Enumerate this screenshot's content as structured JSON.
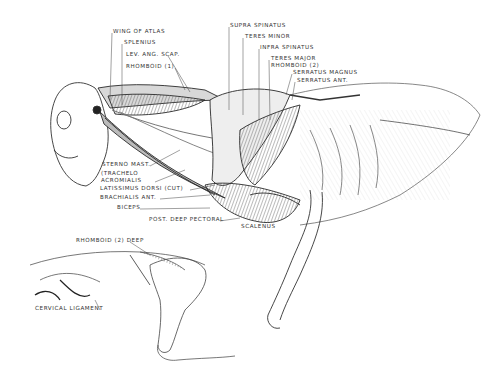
{
  "diagram": {
    "labels_top_left": [
      {
        "text": "Wing of Atlas",
        "x": 113,
        "y": 31
      },
      {
        "text": "Splenius",
        "x": 124,
        "y": 42
      },
      {
        "text": "Lev. Ang. Scap.",
        "x": 126,
        "y": 54
      },
      {
        "text": "Rhomboid (1)",
        "x": 126,
        "y": 66
      }
    ],
    "labels_top_right": [
      {
        "text": "Supra Spinatus",
        "x": 230,
        "y": 25
      },
      {
        "text": "Teres Minor",
        "x": 245,
        "y": 36
      },
      {
        "text": "Infra Spinatus",
        "x": 260,
        "y": 47
      },
      {
        "text": "Teres Major",
        "x": 271,
        "y": 58
      },
      {
        "text": "Rhomboid (2)",
        "x": 271,
        "y": 65
      },
      {
        "text": "Serratus Magnus",
        "x": 293,
        "y": 72
      },
      {
        "text": "Serratus Ant.",
        "x": 297,
        "y": 80
      }
    ],
    "labels_bottom_left": [
      {
        "text": "Sterno Mast.",
        "x": 102,
        "y": 164
      },
      {
        "text": "(Trachelo",
        "x": 101,
        "y": 173
      },
      {
        "text": "Acromialis",
        "x": 101,
        "y": 180
      },
      {
        "text": "Latissimus Dorsi (Cut)",
        "x": 100,
        "y": 188
      },
      {
        "text": "Brachialis Ant.",
        "x": 100,
        "y": 197
      },
      {
        "text": "Biceps",
        "x": 117,
        "y": 207
      },
      {
        "text": "Post. Deep Pectoral",
        "x": 149,
        "y": 219
      },
      {
        "text": "Scalenus",
        "x": 241,
        "y": 226
      }
    ],
    "labels_inset": [
      {
        "text": "Rhomboid (2) Deep",
        "x": 76,
        "y": 240
      },
      {
        "text": "Cervical Ligament",
        "x": 35,
        "y": 308
      }
    ],
    "colors": {
      "ink": "#2a2a2a",
      "shade": "#555555",
      "light": "#9a9a9a",
      "paper": "#ffffff"
    }
  }
}
